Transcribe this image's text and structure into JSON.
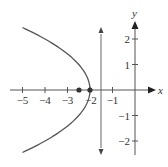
{
  "diagram": {
    "type": "parabola",
    "equation": "y^2 = -2(x + 2)",
    "vertex": [
      -2,
      0
    ],
    "focus": [
      -2.5,
      0
    ],
    "directrix_x": -1.5,
    "axes": {
      "x_label": "x",
      "y_label": "y",
      "x_ticks": [
        {
          "value": -5,
          "label": "−5"
        },
        {
          "value": -4,
          "label": "−4"
        },
        {
          "value": -3,
          "label": "−3"
        },
        {
          "value": -2,
          "label": "−2"
        },
        {
          "value": -1,
          "label": "−1"
        }
      ],
      "y_ticks": [
        {
          "value": 2,
          "label": "2"
        },
        {
          "value": 1,
          "label": "1"
        },
        {
          "value": -1,
          "label": "−1"
        },
        {
          "value": -2,
          "label": "−2"
        }
      ]
    },
    "colors": {
      "curve": "#555555",
      "axes": "#555555",
      "points": "#333333"
    }
  }
}
